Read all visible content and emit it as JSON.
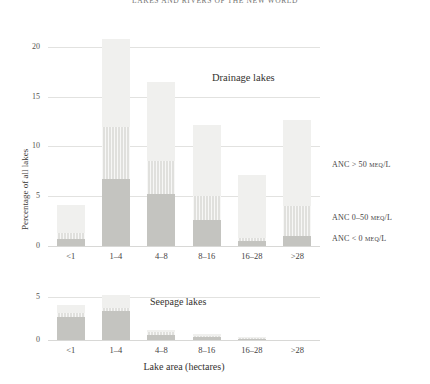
{
  "figure": {
    "title": "LAKES AND RIVERS OF THE NEW WORLD"
  },
  "legend": {
    "position": "right",
    "items": [
      {
        "key": "high",
        "label": "ANC > 50 µeq/L",
        "color": "#f0f0ee"
      },
      {
        "key": "mid",
        "label": "ANC 0–50 µeq/L",
        "color": "#e0e0dd"
      },
      {
        "key": "low",
        "label": "ANC < 0 µeq/L",
        "color": "#c4c4c0"
      }
    ]
  },
  "axes": {
    "xlabel": "Lake area (hectares)",
    "ylabel": "Percentage of all lakes",
    "categories": [
      "<1",
      "1–4",
      "4–8",
      "8–16",
      "16–28",
      ">28"
    ],
    "top_yticks": [
      "0",
      "5",
      "10",
      "15",
      "20"
    ],
    "bottom_yticks": [
      "0",
      "5"
    ]
  },
  "panels": {
    "top": {
      "note": "Drainage lakes"
    },
    "bottom": {
      "note": "Seepage lakes"
    }
  },
  "chart_data": {
    "type": "bar",
    "subtype": "stacked",
    "title": "LAKES AND RIVERS OF THE NEW WORLD",
    "xlabel": "Lake area (hectares)",
    "ylabel": "Percentage of all lakes",
    "categories": [
      "<1",
      "1–4",
      "4–8",
      "8–16",
      "16–28",
      ">28"
    ],
    "grid": true,
    "legend": [
      "ANC < 0 µeq/L",
      "ANC 0–50 µeq/L",
      "ANC > 50 µeq/L"
    ],
    "panels": [
      {
        "name": "Drainage lakes",
        "ylim": [
          0,
          21.5
        ],
        "yticks": [
          0,
          5,
          10,
          15,
          20
        ],
        "series": [
          {
            "name": "ANC < 0 µeq/L",
            "values": [
              0.7,
              6.7,
              5.2,
              2.6,
              0.5,
              1.0
            ]
          },
          {
            "name": "ANC 0–50 µeq/L",
            "values": [
              0.6,
              5.3,
              3.3,
              2.4,
              0.3,
              3.0
            ]
          },
          {
            "name": "ANC > 50 µeq/L",
            "values": [
              2.8,
              8.8,
              8.0,
              7.2,
              6.3,
              8.7
            ]
          }
        ],
        "totals": [
          4.1,
          20.8,
          16.5,
          12.2,
          7.1,
          12.7
        ]
      },
      {
        "name": "Seepage lakes",
        "ylim": [
          0,
          5.6
        ],
        "yticks": [
          0,
          5
        ],
        "series": [
          {
            "name": "ANC < 0 µeq/L",
            "values": [
              2.7,
              3.4,
              0.6,
              0.3,
              0.15,
              0.0
            ]
          },
          {
            "name": "ANC 0–50 µeq/L",
            "values": [
              0.5,
              0.3,
              0.3,
              0.2,
              0.1,
              0.0
            ]
          },
          {
            "name": "ANC > 50 µeq/L",
            "values": [
              0.9,
              1.6,
              0.3,
              0.2,
              0.05,
              0.0
            ]
          }
        ],
        "totals": [
          4.1,
          5.3,
          1.2,
          0.7,
          0.3,
          0.0
        ]
      }
    ]
  }
}
